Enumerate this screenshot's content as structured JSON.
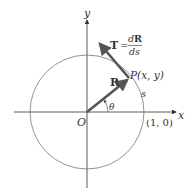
{
  "diagram": {
    "axes": {
      "x_label": "x",
      "y_label": "y",
      "origin_label": "O"
    },
    "circle": {
      "type": "unit circle",
      "point_label": "(1, 0)"
    },
    "point_P": {
      "label": "P(x, y)"
    },
    "vector_R": {
      "label": "R"
    },
    "vector_T": {
      "label_T": "T",
      "equals": "=",
      "numerator": "dR",
      "numerator_d": "d",
      "numerator_R": "R",
      "denominator": "ds"
    },
    "angle": {
      "label": "θ"
    },
    "arc": {
      "label": "s"
    },
    "colors": {
      "axis": "#333333",
      "circle": "#777777",
      "vector": "#555555",
      "text": "#333333"
    }
  }
}
